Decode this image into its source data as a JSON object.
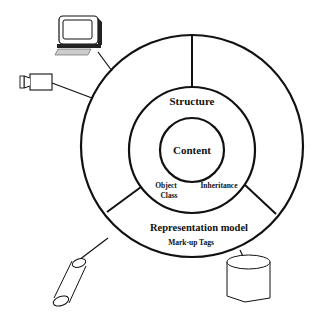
{
  "diagram": {
    "layers": {
      "inner": "Content",
      "middle": "Structure",
      "outer": "Representation model"
    },
    "annotations": {
      "object_class_line1": "Object",
      "object_class_line2": "Class",
      "inheritance": "Inheritance",
      "markup_tags": "Mark-up Tags"
    },
    "devices": [
      "computer-terminal",
      "video-camera",
      "tube",
      "database-cylinder"
    ],
    "colors": {
      "stroke": "#111111",
      "background": "#ffffff"
    }
  }
}
